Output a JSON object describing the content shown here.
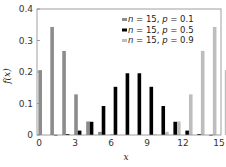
{
  "chart_data": {
    "type": "bar",
    "title": "",
    "xlabel": "x",
    "ylabel": "f(x)",
    "xlim": [
      0,
      15
    ],
    "ylim": [
      0,
      0.4
    ],
    "xticks": [
      0,
      3,
      6,
      9,
      12,
      15
    ],
    "yticks": [
      0,
      0.1,
      0.2,
      0.3,
      0.4
    ],
    "ytick_labels": [
      "0",
      "0.1",
      "0.2",
      "0.3",
      "0.4"
    ],
    "grid": false,
    "legend_position": "upper right",
    "categories": [
      0,
      1,
      2,
      3,
      4,
      5,
      6,
      7,
      8,
      9,
      10,
      11,
      12,
      13,
      14,
      15
    ],
    "series": [
      {
        "name": "n = 15, p = 0.1",
        "color": "#8c8c8c",
        "values": [
          0.206,
          0.343,
          0.267,
          0.129,
          0.043,
          0.01,
          0.002,
          0.0,
          0.0,
          0.0,
          0.0,
          0.0,
          0.0,
          0.0,
          0.0,
          0.0
        ]
      },
      {
        "name": "n = 15, p = 0.5",
        "color": "#000000",
        "values": [
          0.0,
          0.0005,
          0.003,
          0.014,
          0.042,
          0.092,
          0.153,
          0.196,
          0.196,
          0.153,
          0.092,
          0.042,
          0.014,
          0.003,
          0.0005,
          0.0
        ]
      },
      {
        "name": "n = 15, p = 0.9",
        "color": "#bdbdbd",
        "values": [
          0.0,
          0.0,
          0.0,
          0.0,
          0.0,
          0.0,
          0.0,
          0.0,
          0.0,
          0.002,
          0.01,
          0.043,
          0.129,
          0.267,
          0.343,
          0.206
        ]
      }
    ]
  }
}
